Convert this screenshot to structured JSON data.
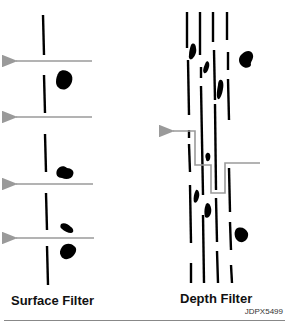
{
  "figure": {
    "labels": {
      "surface": "Surface Filter",
      "depth": "Depth Filter"
    },
    "code": "JDPX5499",
    "colors": {
      "filter_line": "#000000",
      "particle": "#000000",
      "flow_arrow": "#9a9a9a",
      "background": "#ffffff"
    },
    "surface_filter": {
      "media": "single thin layer",
      "flow_arrows": 4,
      "particles_trapped_on_surface": 5
    },
    "depth_filter": {
      "media_layers": 4,
      "flow_path": "tortuous, right to left",
      "particles_trapped_in_depth": 9
    }
  }
}
